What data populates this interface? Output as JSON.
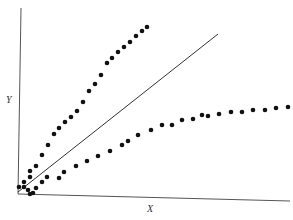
{
  "chart_data": {
    "type": "scatter",
    "title": "",
    "xlabel": "X",
    "ylabel": "Y",
    "grid": false,
    "legend": null,
    "ticks": false,
    "plot_box": {
      "x0": 18,
      "y0": 194,
      "x1": 290,
      "y_top": 8
    },
    "reference_line": {
      "from": [
        0,
        0
      ],
      "to": [
        0.74,
        0.85
      ],
      "label": "y = x"
    },
    "series": [
      {
        "name": "upper (above line)",
        "color": "#111111",
        "points_px": [
          [
            19,
            187
          ],
          [
            24,
            182
          ],
          [
            30,
            177
          ],
          [
            30,
            171
          ],
          [
            36,
            166
          ],
          [
            42,
            155
          ],
          [
            48,
            145
          ],
          [
            54,
            134
          ],
          [
            59,
            128
          ],
          [
            65,
            122
          ],
          [
            71,
            117
          ],
          [
            77,
            111
          ],
          [
            83,
            102
          ],
          [
            89,
            91
          ],
          [
            95,
            84
          ],
          [
            101,
            75
          ],
          [
            107,
            63
          ],
          [
            112,
            58
          ],
          [
            118,
            52
          ],
          [
            124,
            47
          ],
          [
            130,
            42
          ],
          [
            136,
            36
          ],
          [
            142,
            31
          ],
          [
            147,
            27
          ]
        ]
      },
      {
        "name": "lower (below line)",
        "color": "#111111",
        "points_px": [
          [
            24,
            187
          ],
          [
            28,
            190
          ],
          [
            30,
            194
          ],
          [
            33,
            193
          ],
          [
            36,
            188
          ],
          [
            42,
            182
          ],
          [
            47,
            177
          ],
          [
            59,
            178
          ],
          [
            64,
            172
          ],
          [
            76,
            166
          ],
          [
            87,
            161
          ],
          [
            98,
            156
          ],
          [
            110,
            151
          ],
          [
            122,
            145
          ],
          [
            128,
            141
          ],
          [
            138,
            135
          ],
          [
            151,
            130
          ],
          [
            162,
            125
          ],
          [
            172,
            125
          ],
          [
            182,
            120
          ],
          [
            193,
            119
          ],
          [
            202,
            115
          ],
          [
            208,
            116
          ],
          [
            219,
            114
          ],
          [
            231,
            112
          ],
          [
            242,
            112
          ],
          [
            253,
            110
          ],
          [
            265,
            110
          ],
          [
            276,
            108
          ],
          [
            288,
            107
          ]
        ]
      }
    ]
  },
  "labels": {
    "x": "X",
    "y": "Y"
  }
}
